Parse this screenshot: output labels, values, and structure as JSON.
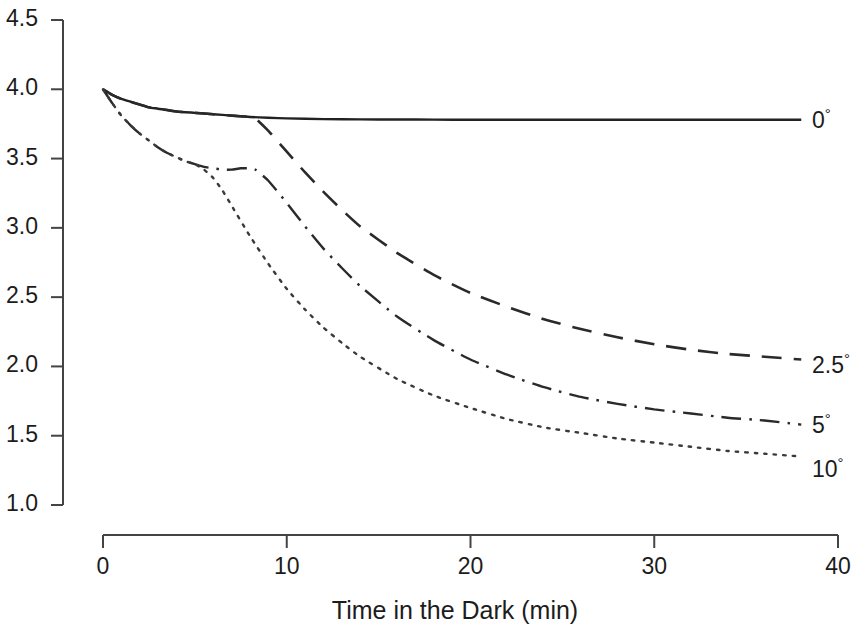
{
  "chart_data": {
    "type": "line",
    "title": "",
    "xlabel": "Time in the Dark (min)",
    "ylabel": "",
    "xlim": [
      0,
      40
    ],
    "ylim": [
      1.0,
      4.5
    ],
    "grid": false,
    "legend_position": "right-of-curves",
    "x_ticks": [
      "0",
      "10",
      "20",
      "30",
      "40"
    ],
    "x_tick_values": [
      0,
      10,
      20,
      30,
      40
    ],
    "y_ticks": [
      "1.0",
      "1.5",
      "2.0",
      "2.5",
      "3.0",
      "3.5",
      "4.0",
      "4.5"
    ],
    "y_tick_values": [
      1.0,
      1.5,
      2.0,
      2.5,
      3.0,
      3.5,
      4.0,
      4.5
    ],
    "series": [
      {
        "name": "0",
        "label": "0",
        "degree_symbol": "°",
        "line_style": "solid",
        "color": "#222222",
        "x": [
          0,
          0.5,
          1,
          1.5,
          2,
          2.5,
          3,
          4,
          5,
          6,
          7,
          8,
          9,
          10,
          12,
          14,
          16,
          18,
          20,
          24,
          28,
          32,
          36,
          38
        ],
        "values": [
          4.0,
          3.96,
          3.93,
          3.91,
          3.89,
          3.87,
          3.86,
          3.84,
          3.83,
          3.82,
          3.81,
          3.8,
          3.795,
          3.79,
          3.785,
          3.783,
          3.782,
          3.781,
          3.78,
          3.78,
          3.78,
          3.78,
          3.78,
          3.78
        ]
      },
      {
        "name": "2.5",
        "label": "2.5",
        "degree_symbol": "°",
        "line_style": "dashed",
        "color": "#2a2a2a",
        "x": [
          0,
          0.5,
          1,
          1.5,
          2,
          2.5,
          3,
          4,
          5,
          6,
          7,
          8,
          8.3,
          9,
          10,
          11,
          12,
          13,
          14,
          16,
          18,
          20,
          22,
          24,
          26,
          28,
          30,
          32,
          34,
          36,
          38
        ],
        "values": [
          4.0,
          3.96,
          3.93,
          3.91,
          3.89,
          3.87,
          3.86,
          3.84,
          3.83,
          3.82,
          3.81,
          3.8,
          3.79,
          3.7,
          3.55,
          3.4,
          3.26,
          3.13,
          3.01,
          2.82,
          2.66,
          2.53,
          2.43,
          2.34,
          2.27,
          2.21,
          2.16,
          2.12,
          2.09,
          2.07,
          2.05
        ]
      },
      {
        "name": "5",
        "label": "5",
        "degree_symbol": "°",
        "line_style": "dashdot",
        "color": "#2a2a2a",
        "x": [
          0,
          0.5,
          1,
          1.5,
          2,
          2.5,
          3,
          3.5,
          4,
          4.5,
          5,
          5.5,
          6,
          6.5,
          7,
          7.5,
          8,
          8.3,
          9,
          10,
          11,
          12,
          13,
          14,
          16,
          18,
          20,
          22,
          24,
          26,
          28,
          30,
          32,
          34,
          36,
          38
        ],
        "values": [
          4.0,
          3.9,
          3.81,
          3.74,
          3.68,
          3.63,
          3.58,
          3.54,
          3.51,
          3.48,
          3.46,
          3.44,
          3.43,
          3.42,
          3.42,
          3.43,
          3.43,
          3.42,
          3.34,
          3.18,
          3.01,
          2.85,
          2.71,
          2.58,
          2.36,
          2.19,
          2.05,
          1.94,
          1.85,
          1.78,
          1.73,
          1.69,
          1.66,
          1.63,
          1.61,
          1.58
        ]
      },
      {
        "name": "10",
        "label": "10",
        "degree_symbol": "°",
        "line_style": "dotted",
        "color": "#3a3a3a",
        "x": [
          0,
          0.5,
          1,
          1.5,
          2,
          2.5,
          3,
          3.5,
          4,
          4.5,
          5,
          5.5,
          6,
          6.5,
          7,
          8,
          9,
          10,
          11,
          12,
          13,
          14,
          16,
          18,
          20,
          22,
          24,
          26,
          28,
          30,
          32,
          34,
          36,
          38
        ],
        "values": [
          4.0,
          3.9,
          3.81,
          3.74,
          3.68,
          3.63,
          3.58,
          3.54,
          3.51,
          3.48,
          3.46,
          3.42,
          3.36,
          3.27,
          3.16,
          2.94,
          2.74,
          2.56,
          2.41,
          2.28,
          2.17,
          2.07,
          1.91,
          1.79,
          1.7,
          1.62,
          1.56,
          1.52,
          1.48,
          1.45,
          1.42,
          1.39,
          1.37,
          1.35
        ]
      }
    ],
    "series_label_positions": [
      {
        "label": "0",
        "x_px": 812,
        "y_px": 107
      },
      {
        "label": "2.5",
        "x_px": 812,
        "y_px": 352
      },
      {
        "label": "5",
        "x_px": 812,
        "y_px": 412
      },
      {
        "label": "10",
        "x_px": 812,
        "y_px": 456
      }
    ]
  },
  "axes": {
    "x_title": "Time in the Dark (min)",
    "y_title": ""
  }
}
